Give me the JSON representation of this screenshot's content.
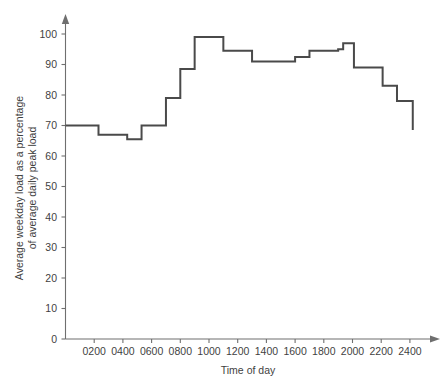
{
  "chart_data": {
    "type": "line",
    "subtype": "step",
    "title": "",
    "xlabel": "Time of day",
    "ylabel": "Average weekday load as a percentage of average daily peak load",
    "ylabel_line1": "Average weekday load as a percentage",
    "ylabel_line2": "of average daily peak load",
    "xlim": [
      0,
      2400
    ],
    "ylim": [
      0,
      104
    ],
    "grid": false,
    "legend": false,
    "xticks": [
      200,
      400,
      600,
      800,
      1000,
      1200,
      1400,
      1600,
      1800,
      2000,
      2200,
      2400
    ],
    "xtick_labels": [
      "0200",
      "0400",
      "0600",
      "0800",
      "1000",
      "1200",
      "1400",
      "1600",
      "1800",
      "2000",
      "2200",
      "2400"
    ],
    "yticks": [
      0,
      10,
      20,
      30,
      40,
      50,
      60,
      70,
      80,
      90,
      100
    ],
    "ytick_labels": [
      "0",
      "10",
      "20",
      "30",
      "40",
      "50",
      "60",
      "70",
      "80",
      "90",
      "100"
    ],
    "line_color": "#4a4a4a",
    "axis_color": "#6f6f6f",
    "steps": [
      {
        "x_start": 0,
        "x_end": 230,
        "value": 70.0
      },
      {
        "x_start": 230,
        "x_end": 430,
        "value": 67.0
      },
      {
        "x_start": 430,
        "x_end": 530,
        "value": 65.5
      },
      {
        "x_start": 530,
        "x_end": 700,
        "value": 70.0
      },
      {
        "x_start": 700,
        "x_end": 800,
        "value": 79.0
      },
      {
        "x_start": 800,
        "x_end": 900,
        "value": 88.5
      },
      {
        "x_start": 900,
        "x_end": 1100,
        "value": 99.0
      },
      {
        "x_start": 1100,
        "x_end": 1300,
        "value": 94.5
      },
      {
        "x_start": 1300,
        "x_end": 1600,
        "value": 91.0
      },
      {
        "x_start": 1600,
        "x_end": 1700,
        "value": 92.5
      },
      {
        "x_start": 1700,
        "x_end": 1900,
        "value": 94.5
      },
      {
        "x_start": 1900,
        "x_end": 1935,
        "value": 95.0
      },
      {
        "x_start": 1935,
        "x_end": 2010,
        "value": 97.0
      },
      {
        "x_start": 2010,
        "x_end": 2210,
        "value": 89.0
      },
      {
        "x_start": 2210,
        "x_end": 2310,
        "value": 83.0
      },
      {
        "x_start": 2310,
        "x_end": 2420,
        "value": 78.0
      },
      {
        "x_start": 2420,
        "x_end": 2420,
        "value": 68.5
      }
    ],
    "x": [
      0,
      230,
      430,
      530,
      700,
      800,
      900,
      1100,
      1300,
      1600,
      1700,
      1900,
      1935,
      2010,
      2210,
      2310,
      2420
    ],
    "values": [
      70.0,
      67.0,
      65.5,
      70.0,
      79.0,
      88.5,
      99.0,
      94.5,
      91.0,
      92.5,
      94.5,
      95.0,
      97.0,
      89.0,
      83.0,
      78.0,
      68.5
    ],
    "end_value": 68.5
  },
  "caption": ""
}
